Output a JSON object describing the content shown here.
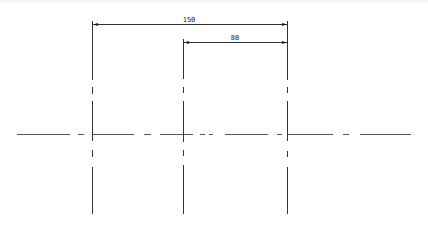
{
  "drawing": {
    "type": "technical-drawing",
    "line_color": "#333333",
    "centerline_color": "#555555",
    "dimensions": [
      {
        "label": "150",
        "from_x": 92,
        "to_x": 287.5,
        "y": 24,
        "text_x": 189,
        "text_y": 21
      },
      {
        "label": "80",
        "from_x": 183,
        "to_x": 287.5,
        "y": 42,
        "text_x": 235,
        "text_y": 39
      }
    ],
    "vertical_centerlines": [
      {
        "name": "left",
        "x": 92,
        "top": 21
      },
      {
        "name": "middle",
        "x": 183,
        "top": 39
      },
      {
        "name": "right",
        "x": 287.5,
        "top": 21
      }
    ],
    "horizontal_centerline": {
      "y": 134,
      "x_start": 17,
      "x_end": 411
    }
  }
}
